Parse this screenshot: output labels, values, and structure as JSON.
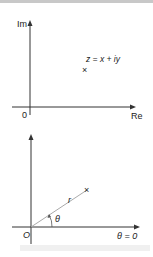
{
  "diagrams": [
    {
      "name": "cartesian-complex-plane",
      "y_axis_label": "Im",
      "x_axis_label": "Re",
      "origin_label": "0",
      "point_label": "z = x + iy",
      "point_marker": "×"
    },
    {
      "name": "polar-complex-plane",
      "origin_label": "O",
      "radius_label": "r",
      "angle_label": "θ",
      "reference_label": "θ = 0",
      "point_marker": "×"
    }
  ],
  "colors": {
    "axis": "#333333",
    "ray": "#aaaaaa",
    "text": "#222222",
    "top_bar": "#c8c8c8"
  }
}
